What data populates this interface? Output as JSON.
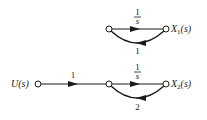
{
  "diagram": {
    "type": "signal-flow-graph",
    "nodes": [
      {
        "id": "a1",
        "x": 109,
        "y": 29,
        "label": ""
      },
      {
        "id": "x1",
        "x": 166,
        "y": 29,
        "label": "X1(s)",
        "label_main": "X",
        "label_sub": "1",
        "label_arg": "(s)"
      },
      {
        "id": "u",
        "x": 38,
        "y": 84,
        "label": "U(s)",
        "label_main": "U",
        "label_arg": "(s)"
      },
      {
        "id": "b1",
        "x": 109,
        "y": 84,
        "label": ""
      },
      {
        "id": "x2",
        "x": 166,
        "y": 84,
        "label": "X2(s)",
        "label_main": "X",
        "label_sub": "2",
        "label_arg": "(s)"
      }
    ],
    "branches": [
      {
        "from": "a1",
        "to": "x1",
        "gain": "1/s",
        "gain_num": "1",
        "gain_den": "s"
      },
      {
        "from": "x1",
        "to": "a1",
        "gain": "1",
        "kind": "feedback"
      },
      {
        "from": "u",
        "to": "b1",
        "gain": "1"
      },
      {
        "from": "b1",
        "to": "x2",
        "gain": "1/s",
        "gain_num": "1",
        "gain_den": "s"
      },
      {
        "from": "x2",
        "to": "b1",
        "gain": "2",
        "kind": "feedback"
      }
    ]
  },
  "colors": {
    "stroke": "#1a1a1a",
    "background": "#ffffff"
  }
}
